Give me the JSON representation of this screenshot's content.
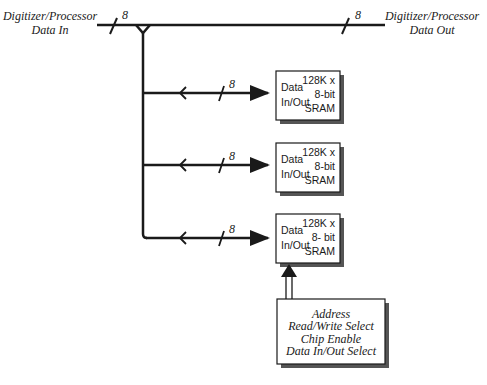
{
  "diagram": {
    "bus_width_label": "8",
    "input": {
      "line1": "Digitizer/Processor",
      "line2": "Data In"
    },
    "output": {
      "line1": "Digitizer/Processor",
      "line2": "Data Out"
    },
    "srams": [
      {
        "port_line1": "Data",
        "port_line2": "In/Out",
        "spec_line1": "128K x",
        "spec_line2": "8-bit",
        "spec_line3": "SRAM",
        "bus_label": "8"
      },
      {
        "port_line1": "Data",
        "port_line2": "In/Out",
        "spec_line1": "128K x",
        "spec_line2": "8-bit",
        "spec_line3": "SRAM",
        "bus_label": "8"
      },
      {
        "port_line1": "Data",
        "port_line2": "In/Out",
        "spec_line1": "128K x",
        "spec_line2": "8- bit",
        "spec_line3": "SRAM",
        "bus_label": "8"
      }
    ],
    "control": {
      "lines": [
        "Address",
        "Read/Write Select",
        "Chip Enable",
        "Data In/Out Select"
      ]
    },
    "colors": {
      "line": "#1a1a1a",
      "shadow": "#555555",
      "box_fill": "#ffffff"
    }
  }
}
